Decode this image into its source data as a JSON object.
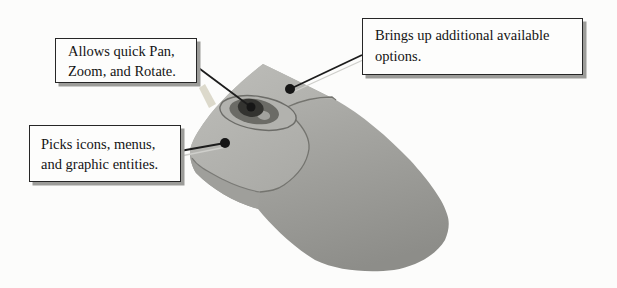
{
  "canvas": {
    "background": "#fcfcfb",
    "width": 617,
    "height": 288,
    "subject": "annotated diagram of a two-button scroll-wheel mouse"
  },
  "callouts": [
    {
      "target": "scroll-wheel",
      "text": "Allows quick Pan, Zoom, and Rotate.",
      "lines": [
        "Allows quick Pan,",
        "Zoom, and Rotate."
      ]
    },
    {
      "target": "right-mouse-button",
      "text": "Brings up additional available options.",
      "lines": [
        "Brings up additional available",
        "options."
      ]
    },
    {
      "target": "left-mouse-button",
      "text": "Picks icons, menus, and graphic entities.",
      "lines": [
        "Picks icons, menus,",
        "and graphic entities."
      ]
    }
  ],
  "colors": {
    "box_background": "#fdfdfc",
    "box_border": "#262626",
    "box_shadow": "#9c9c99",
    "callout_line": "#1c1c1c",
    "callout_dot": "#161616",
    "mouse_body_light": "#bcbcb8",
    "mouse_body_mid": "#a6a6a2",
    "mouse_body_dark": "#8d8d89",
    "mouse_seam": "#74746f",
    "wheel_recess_outer": "#b2b2ae",
    "wheel_recess_inner": "#6b6b66",
    "wheel": "#333330",
    "wheel_highlight": "#a2a29e",
    "cable": "#dcd9cb"
  }
}
